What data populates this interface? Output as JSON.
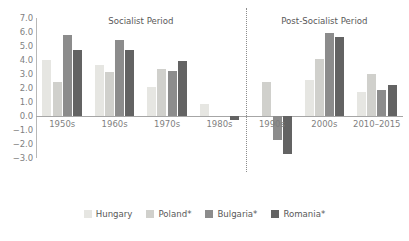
{
  "chart_data": {
    "type": "bar",
    "title": "",
    "xlabel": "",
    "ylabel": "",
    "ylim": [
      -3.0,
      7.0
    ],
    "ytick_step": 1.0,
    "yticks": [
      "7.0",
      "6.0",
      "5.0",
      "4.0",
      "3.0",
      "2.0",
      "1.0",
      "0.0",
      "-1.0",
      "-2.0",
      "-3.0"
    ],
    "grid": false,
    "legend_position": "bottom",
    "categories": [
      "1950s",
      "1960s",
      "1970s",
      "1980s",
      "1990s",
      "2000s",
      "2010–2015"
    ],
    "series": [
      {
        "name": "Hungary",
        "color": "#e6e6e2",
        "values": [
          4.0,
          3.65,
          2.1,
          0.85,
          0.0,
          2.6,
          1.75
        ]
      },
      {
        "name": "Poland*",
        "color": "#d0d0cc",
        "values": [
          2.4,
          3.15,
          3.35,
          0.0,
          2.4,
          4.1,
          3.0
        ]
      },
      {
        "name": "Bulgaria*",
        "color": "#8c8c8c",
        "values": [
          5.8,
          5.45,
          3.2,
          0.0,
          -1.7,
          5.9,
          1.85
        ]
      },
      {
        "name": "Romania*",
        "color": "#636363",
        "values": [
          4.7,
          4.75,
          3.95,
          -0.3,
          -2.7,
          5.65,
          2.25
        ]
      }
    ],
    "annotations": [
      {
        "name": "socialist-period",
        "label": "Socialist Period"
      },
      {
        "name": "post-socialist-period",
        "label": "Post-Socialist Period"
      }
    ]
  },
  "colors": {
    "hungary": "#e6e6e2",
    "poland": "#d0d0cc",
    "bulgaria": "#8c8c8c",
    "romania": "#636363",
    "axis": "#b8b8b8",
    "baseline": "#a6a6a6",
    "tick_text": "#7f7f7f",
    "title_text": "#595959",
    "divider": "#8c8c8c",
    "background": "#ffffff"
  }
}
